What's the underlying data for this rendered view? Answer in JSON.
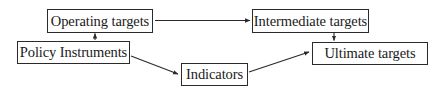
{
  "diagram": {
    "nodes": [
      {
        "id": "operating",
        "label": "Operating targets"
      },
      {
        "id": "policy",
        "label": "Policy Instruments"
      },
      {
        "id": "indicators",
        "label": "Indicators"
      },
      {
        "id": "intermediate",
        "label": "Intermediate targets"
      },
      {
        "id": "ultimate",
        "label": "Ultimate targets"
      }
    ],
    "edges": [
      {
        "from": "policy",
        "to": "operating"
      },
      {
        "from": "operating",
        "to": "intermediate"
      },
      {
        "from": "policy",
        "to": "indicators"
      },
      {
        "from": "indicators",
        "to": "ultimate"
      },
      {
        "from": "intermediate",
        "to": "ultimate"
      }
    ],
    "colors": {
      "line": "#2a2a2a",
      "background": "#ffffff"
    }
  }
}
